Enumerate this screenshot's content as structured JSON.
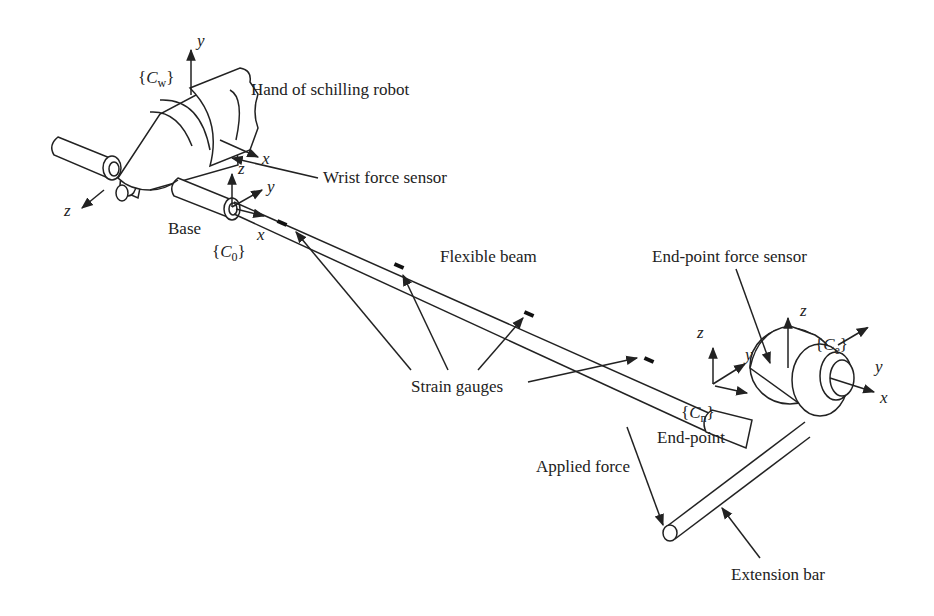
{
  "diagram": {
    "labels": {
      "hand": "Hand of schilling robot",
      "wrist_sensor": "Wrist force sensor",
      "base": "Base",
      "flexible_beam": "Flexible beam",
      "end_point_sensor": "End-point force sensor",
      "strain_gauges": "Strain gauges",
      "end_point": "End-point",
      "applied_force": "Applied force",
      "extension_bar": "Extension bar"
    },
    "frames": {
      "wrist": {
        "name": "C",
        "sub": "w"
      },
      "base": {
        "name": "C",
        "sub": "0"
      },
      "end_point": {
        "name": "C",
        "sub": "n"
      },
      "end_effector": {
        "name": "C",
        "sub": "e"
      }
    },
    "axes": {
      "x": "x",
      "y": "y",
      "z": "z"
    },
    "strain_gauge_count": 4,
    "colors": {
      "line": "#222222",
      "background": "#ffffff"
    }
  }
}
